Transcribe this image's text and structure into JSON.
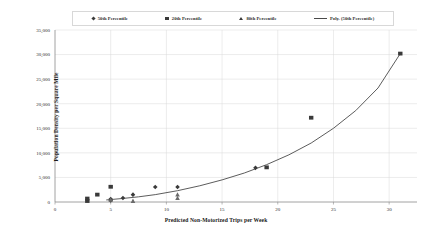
{
  "chart_data": {
    "type": "scatter",
    "title": "",
    "xlabel": "Predicted Non-Motorized Trips per Week",
    "ylabel": "Population Density per Square Mile",
    "xlim": [
      0,
      32.5
    ],
    "ylim": [
      0,
      35000
    ],
    "xticks": [
      0,
      5,
      10,
      15,
      20,
      25,
      30
    ],
    "xticklabels": [
      "0",
      "5",
      "10",
      "15",
      "20",
      "25",
      "30"
    ],
    "yticks": [
      0,
      5000,
      10000,
      15000,
      20000,
      25000,
      30000,
      35000
    ],
    "yticklabels": [
      "0",
      "5,000",
      "10,000",
      "15,000",
      "20,000",
      "25,000",
      "30,000",
      "35,000"
    ],
    "grid": true,
    "legend_position": "top",
    "series": [
      {
        "name": "50th Percentile",
        "marker": "diamond",
        "color": "#3a3a3a",
        "points": [
          {
            "x": 5.0,
            "y": 600
          },
          {
            "x": 5.0,
            "y": 300
          },
          {
            "x": 6.1,
            "y": 800
          },
          {
            "x": 7.0,
            "y": 1500
          },
          {
            "x": 9.0,
            "y": 3050
          },
          {
            "x": 11.0,
            "y": 3050
          },
          {
            "x": 18.0,
            "y": 6950
          }
        ]
      },
      {
        "name": "20th Percentile",
        "marker": "square",
        "color": "#3a3a3a",
        "points": [
          {
            "x": 2.9,
            "y": 700
          },
          {
            "x": 2.9,
            "y": 200
          },
          {
            "x": 3.8,
            "y": 1500
          },
          {
            "x": 5.0,
            "y": 3100
          },
          {
            "x": 19.0,
            "y": 7050
          },
          {
            "x": 23.0,
            "y": 17150
          },
          {
            "x": 31.0,
            "y": 30200
          }
        ]
      },
      {
        "name": "80th Percentile",
        "marker": "triangle",
        "color": "#6a6a6a",
        "points": [
          {
            "x": 5.0,
            "y": 450
          },
          {
            "x": 7.0,
            "y": 200
          },
          {
            "x": 11.0,
            "y": 1500
          },
          {
            "x": 11.0,
            "y": 800
          }
        ]
      }
    ],
    "trendline": {
      "name": "Poly. (50th Percentile)",
      "color": "#4a4a4a",
      "type": "polynomial",
      "points": [
        {
          "x": 4.6,
          "y": 420
        },
        {
          "x": 6.0,
          "y": 700
        },
        {
          "x": 7.5,
          "y": 1050
        },
        {
          "x": 9.0,
          "y": 1500
        },
        {
          "x": 11.0,
          "y": 2300
        },
        {
          "x": 13.0,
          "y": 3300
        },
        {
          "x": 15.0,
          "y": 4500
        },
        {
          "x": 17.0,
          "y": 5900
        },
        {
          "x": 19.0,
          "y": 7600
        },
        {
          "x": 21.0,
          "y": 9600
        },
        {
          "x": 23.0,
          "y": 12000
        },
        {
          "x": 25.0,
          "y": 15000
        },
        {
          "x": 27.0,
          "y": 18600
        },
        {
          "x": 29.0,
          "y": 23200
        },
        {
          "x": 31.0,
          "y": 30200
        }
      ]
    }
  },
  "legend": {
    "items": [
      {
        "label": "50th Percentile",
        "marker": "diamond"
      },
      {
        "label": "20th Percentile",
        "marker": "square"
      },
      {
        "label": "80th Percentile",
        "marker": "triangle"
      },
      {
        "label": "Poly. (50th Percentile)",
        "marker": "line"
      }
    ]
  },
  "colors": {
    "marker": "#3a3a3a",
    "trendline": "#4a4a4a",
    "grid": "#d9d9d9",
    "axis": "#8a8a8a",
    "text": "#1a1a1a"
  }
}
